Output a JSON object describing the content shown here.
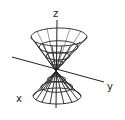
{
  "diagram": {
    "type": "3d-surface-wireframe",
    "surface": "double cone",
    "axes": {
      "z_label": "z",
      "y_label": "y",
      "x_label": "x"
    },
    "colors": {
      "line": "#222222",
      "background": "#ffffff"
    }
  }
}
